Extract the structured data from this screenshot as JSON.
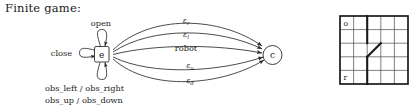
{
  "caption": "Finite game:",
  "automaton": {
    "nodes": [
      {
        "id": "e",
        "label": "e",
        "shape": "square"
      },
      {
        "id": "c",
        "label": "c",
        "shape": "circle"
      }
    ],
    "self_loops": [
      {
        "id": "loop-open",
        "label": "open",
        "position": "top"
      },
      {
        "id": "loop-close",
        "label": "close",
        "position": "left"
      },
      {
        "id": "loop-obs",
        "label": "",
        "position": "bottom"
      }
    ],
    "loop_labels": {
      "open": "open",
      "close": "close",
      "obs_line1": "obs_left  /  obs_right",
      "obs_line2": "obs_up  /  obs_down"
    },
    "transitions": [
      {
        "from": "e",
        "to": "c",
        "label_base": "ε",
        "label_sub": "r",
        "curve": "high-up"
      },
      {
        "from": "e",
        "to": "c",
        "label_base": "ε",
        "label_sub": "l",
        "curve": "up"
      },
      {
        "from": "e",
        "to": "c",
        "label_base": "robot",
        "label_sub": "",
        "curve": "straight"
      },
      {
        "from": "e",
        "to": "c",
        "label_base": "ε",
        "label_sub": "u",
        "curve": "down"
      },
      {
        "from": "e",
        "to": "c",
        "label_base": "ε",
        "label_sub": "d",
        "curve": "low-down"
      }
    ]
  },
  "grid": {
    "rows": 5,
    "cols": 5,
    "cells": [
      {
        "label": "o",
        "row": 0,
        "col": 0
      },
      {
        "label": "r",
        "row": 4,
        "col": 0
      }
    ],
    "walls": [
      {
        "type": "vertical",
        "col_boundary": 2,
        "row_start": 0,
        "row_end": 2
      },
      {
        "type": "diagonal",
        "row": 2,
        "col": 2
      },
      {
        "type": "vertical",
        "col_boundary": 2,
        "row_start": 3,
        "row_end": 5
      }
    ]
  },
  "colors": {
    "ink": "#1a1a1a",
    "stroke": "#2b2b2b",
    "grid_thin": "#4a4a4a",
    "background": "#ffffff"
  }
}
